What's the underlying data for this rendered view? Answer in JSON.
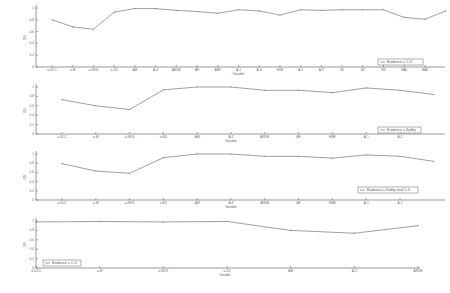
{
  "chart_data": [
    {
      "type": "line",
      "title": "",
      "xlabel": "Variable",
      "ylabel": "OR",
      "ylim": [
        0,
        1
      ],
      "yticks": [
        "0",
        "0.2",
        "0.4",
        "0.6",
        "0.8",
        "1"
      ],
      "legend": [
        "Evidence = C-V"
      ],
      "legend_position": "lower right",
      "categories": [
        "a-DCC",
        "a-M",
        "a-NVG",
        "a-ZD",
        "AM",
        "A-Z",
        "ARDB",
        "AF",
        "ABP",
        "A-1",
        "A-S",
        "HVB",
        "A-2",
        "A-P",
        "B1",
        "B2",
        "B3",
        "HAL",
        "HAV",
        "SF"
      ],
      "values": [
        0.8,
        0.68,
        0.64,
        0.93,
        0.99,
        0.99,
        0.96,
        0.94,
        0.91,
        0.97,
        0.95,
        0.88,
        0.97,
        0.96,
        0.97,
        0.97,
        0.97,
        0.84,
        0.81,
        0.95
      ]
    },
    {
      "type": "line",
      "title": "",
      "xlabel": "Variable",
      "ylabel": "OR",
      "ylim": [
        0,
        1
      ],
      "yticks": [
        "0",
        "0.2",
        "0.4",
        "0.6",
        "0.8",
        "1"
      ],
      "legend": [
        "Evidence = Ksdhy"
      ],
      "legend_position": "lower right",
      "categories": [
        "a-DCC",
        "a-M",
        "a-NVG",
        "a-ED",
        "AM",
        "A-Z",
        "ARDB",
        "AF",
        "HBB",
        "A-1",
        "A-2",
        "HVB",
        "A-S"
      ],
      "values": [
        0.73,
        0.6,
        0.52,
        0.94,
        1.0,
        1.0,
        0.93,
        0.93,
        0.88,
        0.98,
        0.93,
        0.84,
        0.97
      ]
    },
    {
      "type": "line",
      "title": "",
      "xlabel": "Variable",
      "ylabel": "OR",
      "ylim": [
        0,
        1
      ],
      "yticks": [
        "0",
        "0.2",
        "0.4",
        "0.6",
        "0.8",
        "1"
      ],
      "legend": [
        "Evidence = Ksdhy and C-V"
      ],
      "legend_position": "lower right",
      "categories": [
        "a-DCC",
        "a-M",
        "a-NVG",
        "a-ED",
        "AM",
        "A-Z",
        "ARDB",
        "AF",
        "HBB",
        "A-1",
        "A-2",
        "HVB",
        "A-S"
      ],
      "values": [
        0.79,
        0.63,
        0.58,
        0.92,
        1.0,
        1.0,
        0.95,
        0.95,
        0.91,
        0.98,
        0.95,
        0.84,
        0.97
      ]
    },
    {
      "type": "line",
      "title": "",
      "xlabel": "Variable",
      "ylabel": "OR",
      "ylim": [
        0,
        1
      ],
      "yticks": [
        "0",
        "0.2",
        "0.4",
        "0.6",
        "0.8",
        "1"
      ],
      "legend": [
        "Evidence = C-V"
      ],
      "legend_position": "lower left",
      "categories": [
        "a-DCC",
        "a-M",
        "a-NVG",
        "a-ZD",
        "AM",
        "A-Z",
        "ARDB"
      ],
      "values": [
        0.98,
        0.99,
        0.98,
        0.99,
        0.8,
        0.74,
        0.9
      ]
    }
  ]
}
